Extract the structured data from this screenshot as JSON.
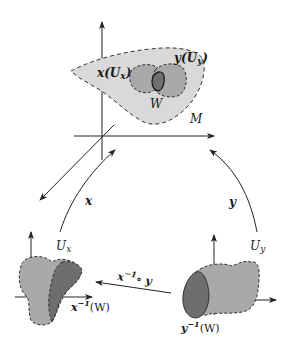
{
  "diagram": {
    "colors": {
      "background": "#ffffff",
      "stroke": "#222222",
      "manifold_fill": "#d9d9d9",
      "chart_fill": "#a9a9a9",
      "overlap_fill": "#6e6e6e"
    },
    "top": {
      "manifold_label": "M",
      "x_image_label": "x(U",
      "x_image_sub": "x",
      "y_image_label": "y(U",
      "y_image_sub": "y",
      "overlap_label": "W",
      "close_paren": ")"
    },
    "arrows": {
      "x_map_label": "x",
      "y_map_label": "y",
      "transition_label": "x",
      "transition_sup": "−1",
      "transition_rest": "∘ y"
    },
    "bottom_left": {
      "domain_label": "U",
      "domain_sub": "x",
      "preimage_label": "x",
      "preimage_sup": "−1",
      "preimage_rest": "(W)"
    },
    "bottom_right": {
      "domain_label": "U",
      "domain_sub": "y",
      "preimage_label": "y",
      "preimage_sup": "−1",
      "preimage_rest": "(W)"
    }
  }
}
